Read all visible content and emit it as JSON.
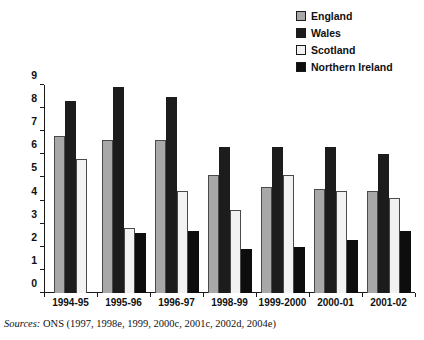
{
  "top_cropped_text": "",
  "legend": {
    "position": "top-right",
    "items": [
      {
        "label": "England",
        "color": "#a8a8a8",
        "key": "england"
      },
      {
        "label": "Wales",
        "color": "#1c1c1c",
        "key": "wales"
      },
      {
        "label": "Scotland",
        "color": "#f2f2f2",
        "key": "scotland"
      },
      {
        "label": "Northern Ireland",
        "color": "#0d0d0d",
        "key": "northern"
      }
    ]
  },
  "source": {
    "lead": "Sources:",
    "text": " ONS (1997, 1998e, 1999, 2000c, 2001c, 2002d, 2004e)"
  },
  "chart_data": {
    "type": "bar",
    "title": "",
    "xlabel": "",
    "ylabel": "",
    "ylim": [
      0,
      9
    ],
    "yticks": [
      0,
      1,
      2,
      3,
      4,
      5,
      6,
      7,
      8,
      9
    ],
    "ytick_labels": [
      "0",
      "1",
      "2",
      "3",
      "4",
      "5",
      "6",
      "7",
      "8",
      "9"
    ],
    "grid": false,
    "legend_position": "top-right",
    "categories": [
      "1994-95",
      "1995-96",
      "1996-97",
      "1998-99",
      "1999-2000",
      "2000-01",
      "2001-02"
    ],
    "series": [
      {
        "name": "England",
        "color": "#a8a8a8",
        "values": [
          6.8,
          6.6,
          6.6,
          5.1,
          4.6,
          4.5,
          4.4
        ]
      },
      {
        "name": "Wales",
        "color": "#1c1c1c",
        "values": [
          8.3,
          8.9,
          8.5,
          6.3,
          6.3,
          6.3,
          6.0
        ]
      },
      {
        "name": "Scotland",
        "color": "#f2f2f2",
        "values": [
          5.8,
          2.8,
          4.4,
          3.6,
          5.1,
          4.4,
          4.1
        ]
      },
      {
        "name": "Northern Ireland",
        "color": "#0d0d0d",
        "values": [
          null,
          2.6,
          2.7,
          1.9,
          2.0,
          2.3,
          2.7
        ]
      }
    ]
  }
}
